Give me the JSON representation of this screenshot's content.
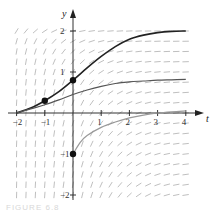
{
  "figure": {
    "caption": "FIGURE 6.8"
  },
  "chart_data": {
    "type": "line",
    "title": "",
    "subtitle": "Slope field with solution curves",
    "xlabel": "t",
    "ylabel": "y",
    "xlim": [
      -2,
      4
    ],
    "ylim": [
      -2,
      2.2
    ],
    "x_ticks": [
      -2,
      -1,
      1,
      2,
      3,
      4
    ],
    "x_tick_labels": [
      "−2",
      "−1",
      "1",
      "2",
      "3",
      "4"
    ],
    "y_ticks": [
      2,
      1,
      -1,
      -2
    ],
    "y_tick_labels": [
      "2",
      "1",
      "−1",
      "−2"
    ],
    "grid": false,
    "legend": null,
    "slope_field": {
      "t_range": [
        -2,
        4
      ],
      "y_range": [
        -2,
        2
      ],
      "description": "Short segments; steep for y far below equilibrium, flattening to horizontal as t increases"
    },
    "series": [
      {
        "name": "solution-upper",
        "x": [
          -2,
          -1.5,
          -1,
          -0.5,
          0,
          0.5,
          1,
          1.5,
          2,
          2.5,
          3,
          3.5,
          4
        ],
        "values": [
          0.0,
          0.12,
          0.3,
          0.52,
          0.8,
          1.1,
          1.38,
          1.62,
          1.8,
          1.9,
          1.96,
          1.99,
          2.0
        ],
        "color": "#222222"
      },
      {
        "name": "solution-middle",
        "x": [
          -2,
          -1.5,
          -1,
          -0.5,
          0,
          0.5,
          1,
          1.5,
          2,
          2.5,
          3,
          3.5,
          4
        ],
        "values": [
          0.0,
          0.1,
          0.2,
          0.32,
          0.45,
          0.56,
          0.65,
          0.72,
          0.76,
          0.78,
          0.8,
          0.81,
          0.82
        ],
        "color": "#555555"
      },
      {
        "name": "solution-lower",
        "x": [
          0,
          0.25,
          0.5,
          1,
          1.5,
          2,
          2.5,
          3,
          3.5,
          4
        ],
        "values": [
          -1.0,
          -0.72,
          -0.55,
          -0.35,
          -0.22,
          -0.12,
          -0.05,
          0.0,
          0.03,
          0.05
        ],
        "color": "#999999"
      }
    ],
    "points": [
      {
        "t": -1,
        "y": 0.3
      },
      {
        "t": 0,
        "y": 0.8
      },
      {
        "t": 0,
        "y": -1
      }
    ]
  }
}
